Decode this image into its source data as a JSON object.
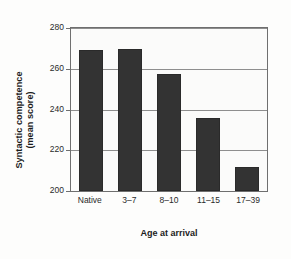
{
  "chart_data": {
    "type": "bar",
    "title": "",
    "subtitle": "",
    "categories": [
      "Native",
      "3–7",
      "8–10",
      "11–15",
      "17–39"
    ],
    "values": [
      269,
      269.5,
      257.5,
      236,
      212
    ],
    "series": [
      {
        "name": "Syntactic competence (mean score)",
        "values": [
          269,
          269.5,
          257.5,
          236,
          212
        ]
      }
    ],
    "xlabel": "Age at arrival",
    "ylabel": "Syntactic competence\n(mean score)",
    "ylabel_line1": "Syntactic competence",
    "ylabel_line2": "(mean score)",
    "ylim": [
      200,
      280
    ],
    "yticks": [
      200,
      220,
      240,
      260,
      280
    ],
    "ytick_labels": [
      "200",
      "220",
      "240",
      "260",
      "280"
    ],
    "grid": true,
    "grid_axis": "y",
    "legend": false,
    "legend_position": "none",
    "bar_color": "#333333",
    "background_color": "#fdfdfc",
    "axis_color": "#6f6f6f",
    "grid_color": "#8e8e8e",
    "text_color": "#1c1c1c"
  }
}
